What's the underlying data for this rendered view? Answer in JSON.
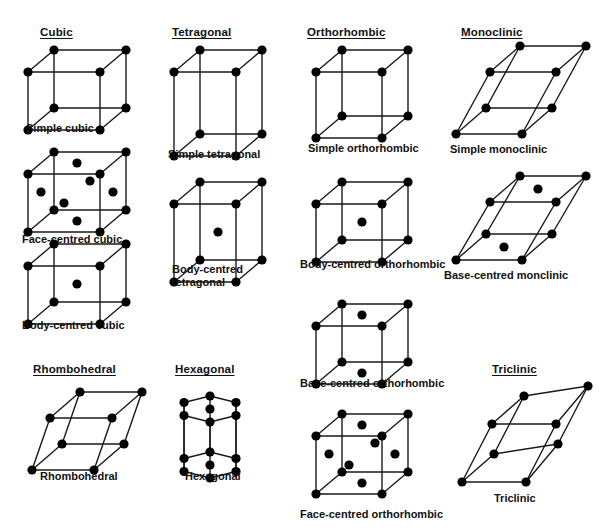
{
  "figure": {
    "kind": "bravais-lattice-chart",
    "title_visible": false,
    "background": "#ffffff",
    "ink": "#0a0a0a",
    "atom_color": "#000000",
    "edge_color": "#1a1a1a"
  },
  "group_titles": [
    {
      "id": "cubic",
      "label": "Cubic",
      "x": 40,
      "y": 26
    },
    {
      "id": "tetragonal",
      "label": "Tetragonal",
      "x": 172,
      "y": 26
    },
    {
      "id": "orthorhombic",
      "label": "Orthorhombic",
      "x": 307,
      "y": 26
    },
    {
      "id": "monoclinic",
      "label": "Monoclinic",
      "x": 461,
      "y": 26
    },
    {
      "id": "rhombohedral",
      "label": "Rhombohedral",
      "x": 33,
      "y": 363
    },
    {
      "id": "hexagonal",
      "label": "Hexagonal",
      "x": 175,
      "y": 363
    },
    {
      "id": "triclinic",
      "label": "Triclinic",
      "x": 492,
      "y": 363
    }
  ],
  "lattices": [
    {
      "id": "simple-cubic",
      "caption": "Simple cubic",
      "shape": "cube",
      "atoms": "corners",
      "atom_count": 8,
      "box": {
        "x": 22,
        "y": 46,
        "w": 110,
        "h": 78
      },
      "geom": {
        "w": 72,
        "h": 58,
        "dx": 26,
        "dy": -22
      },
      "caption_pos": {
        "x": 26,
        "y": 122
      },
      "caption_wrap": false
    },
    {
      "id": "face-centred-cubic",
      "caption": "Face-centred cubic",
      "shape": "cube",
      "atoms": "corners+faces",
      "atom_count": 14,
      "box": {
        "x": 22,
        "y": 148,
        "w": 110,
        "h": 78
      },
      "geom": {
        "w": 72,
        "h": 58,
        "dx": 26,
        "dy": -22
      },
      "caption_pos": {
        "x": 22,
        "y": 233
      },
      "caption_wrap": false
    },
    {
      "id": "body-centred-cubic",
      "caption": "Body-centred cubic",
      "shape": "cube",
      "atoms": "corners+body",
      "atom_count": 9,
      "box": {
        "x": 22,
        "y": 240,
        "w": 110,
        "h": 78
      },
      "geom": {
        "w": 72,
        "h": 58,
        "dx": 26,
        "dy": -22
      },
      "caption_pos": {
        "x": 22,
        "y": 319
      },
      "caption_wrap": false
    },
    {
      "id": "simple-tetragonal",
      "caption": "Simple tetragonal",
      "shape": "cube",
      "atoms": "corners",
      "atom_count": 8,
      "box": {
        "x": 168,
        "y": 46,
        "w": 106,
        "h": 106
      },
      "geom": {
        "w": 62,
        "h": 84,
        "dx": 26,
        "dy": -22
      },
      "caption_pos": {
        "x": 168,
        "y": 148
      },
      "caption_wrap": false
    },
    {
      "id": "body-centred-tetragonal",
      "caption": "Body-centred tetragonal",
      "shape": "cube",
      "atoms": "corners+body",
      "atom_count": 9,
      "box": {
        "x": 168,
        "y": 178,
        "w": 106,
        "h": 100
      },
      "geom": {
        "w": 62,
        "h": 78,
        "dx": 26,
        "dy": -22
      },
      "caption_pos": {
        "x": 172,
        "y": 263
      },
      "caption_wrap": true
    },
    {
      "id": "simple-orthorhombic",
      "caption": "Simple orthorhombic",
      "shape": "cube",
      "atoms": "corners",
      "atom_count": 8,
      "box": {
        "x": 310,
        "y": 46,
        "w": 108,
        "h": 88
      },
      "geom": {
        "w": 66,
        "h": 66,
        "dx": 26,
        "dy": -22
      },
      "caption_pos": {
        "x": 308,
        "y": 142
      },
      "caption_wrap": false
    },
    {
      "id": "body-centred-orthorhombic",
      "caption": "Body-centred orthorhombic",
      "shape": "cube",
      "atoms": "corners+body",
      "atom_count": 9,
      "box": {
        "x": 310,
        "y": 178,
        "w": 108,
        "h": 80
      },
      "geom": {
        "w": 66,
        "h": 58,
        "dx": 26,
        "dy": -22
      },
      "caption_pos": {
        "x": 300,
        "y": 258
      },
      "caption_wrap": false
    },
    {
      "id": "base-centred-orthorhombic",
      "caption": "Base-centred orthorhombic",
      "shape": "cube",
      "atoms": "corners+bases",
      "atom_count": 10,
      "box": {
        "x": 310,
        "y": 300,
        "w": 108,
        "h": 80
      },
      "geom": {
        "w": 66,
        "h": 58,
        "dx": 26,
        "dy": -22
      },
      "caption_pos": {
        "x": 300,
        "y": 377
      },
      "caption_wrap": false
    },
    {
      "id": "face-centred-orthorhombic",
      "caption": "Face-centred orthorhombic",
      "shape": "cube",
      "atoms": "corners+faces",
      "atom_count": 14,
      "box": {
        "x": 310,
        "y": 410,
        "w": 108,
        "h": 80
      },
      "geom": {
        "w": 66,
        "h": 58,
        "dx": 26,
        "dy": -22
      },
      "caption_pos": {
        "x": 300,
        "y": 508
      },
      "caption_wrap": false
    },
    {
      "id": "simple-monoclinic",
      "caption": "Simple monoclinic",
      "shape": "monoclinic",
      "atoms": "corners",
      "atom_count": 8,
      "box": {
        "x": 450,
        "y": 42,
        "w": 130,
        "h": 106
      },
      "geom": {
        "w": 66,
        "h": 62,
        "dx": 30,
        "dy": -26,
        "shear": 34
      },
      "caption_pos": {
        "x": 450,
        "y": 143
      },
      "caption_wrap": false
    },
    {
      "id": "base-centred-monoclinic",
      "caption": "Base-centred monclinic",
      "shape": "monoclinic",
      "atoms": "corners+bases",
      "atom_count": 10,
      "box": {
        "x": 450,
        "y": 172,
        "w": 130,
        "h": 102
      },
      "geom": {
        "w": 66,
        "h": 58,
        "dx": 30,
        "dy": -26,
        "shear": 34
      },
      "caption_pos": {
        "x": 444,
        "y": 269
      },
      "caption_wrap": false
    },
    {
      "id": "rhombohedral",
      "caption": "Rhombohedral",
      "shape": "rhombohedral",
      "atoms": "corners",
      "atom_count": 8,
      "box": {
        "x": 26,
        "y": 388,
        "w": 116,
        "h": 86
      },
      "geom": {
        "w": 62,
        "h": 52,
        "dx": 30,
        "dy": -26,
        "shear": 18
      },
      "caption_pos": {
        "x": 40,
        "y": 470
      },
      "caption_wrap": false
    },
    {
      "id": "hexagonal",
      "caption": "Hexagonal",
      "shape": "hex-prism",
      "atoms": "corners+bases",
      "atom_count": 14,
      "box": {
        "x": 172,
        "y": 388,
        "w": 104,
        "h": 86
      },
      "geom": {
        "rx": 30,
        "ry": 13,
        "h": 56,
        "dy": -10
      },
      "caption_pos": {
        "x": 185,
        "y": 470
      },
      "caption_wrap": false
    },
    {
      "id": "triclinic",
      "caption": "Triclinic",
      "shape": "triclinic",
      "atoms": "corners",
      "atom_count": 8,
      "box": {
        "x": 456,
        "y": 392,
        "w": 132,
        "h": 96
      },
      "geom": {
        "w": 64,
        "h": 58,
        "dx": 32,
        "dy": -28,
        "shear": 30,
        "skew2": 10
      },
      "caption_pos": {
        "x": 494,
        "y": 492
      },
      "caption_wrap": false
    }
  ],
  "chart_data": {
    "type": "diagram",
    "groups": [
      {
        "system": "Cubic",
        "members": [
          "Simple cubic",
          "Face-centred cubic",
          "Body-centred cubic"
        ]
      },
      {
        "system": "Tetragonal",
        "members": [
          "Simple tetragonal",
          "Body-centred tetragonal"
        ]
      },
      {
        "system": "Orthorhombic",
        "members": [
          "Simple orthorhombic",
          "Body-centred orthorhombic",
          "Base-centred orthorhombic",
          "Face-centred orthorhombic"
        ]
      },
      {
        "system": "Monoclinic",
        "members": [
          "Simple monoclinic",
          "Base-centred monclinic"
        ]
      },
      {
        "system": "Rhombohedral",
        "members": [
          "Rhombohedral"
        ]
      },
      {
        "system": "Hexagonal",
        "members": [
          "Hexagonal"
        ]
      },
      {
        "system": "Triclinic",
        "members": [
          "Triclinic"
        ]
      }
    ],
    "atom_counts": {
      "Simple cubic": 8,
      "Face-centred cubic": 14,
      "Body-centred cubic": 9,
      "Simple tetragonal": 8,
      "Body-centred tetragonal": 9,
      "Simple orthorhombic": 8,
      "Body-centred orthorhombic": 9,
      "Base-centred orthorhombic": 10,
      "Face-centred orthorhombic": 14,
      "Simple monoclinic": 8,
      "Base-centred monclinic": 10,
      "Rhombohedral": 8,
      "Hexagonal": 14,
      "Triclinic": 8
    }
  }
}
